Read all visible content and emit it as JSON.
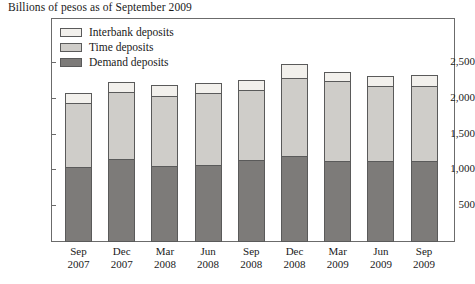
{
  "chart_data": {
    "type": "bar",
    "stacked": true,
    "title": "Billions of pesos as of September 2009",
    "xlabel": "",
    "ylabel": "",
    "ylim": [
      0,
      2750
    ],
    "grid": false,
    "legend_position": "top-left",
    "ytick_labels": [
      "2,500",
      "2,000",
      "1,500",
      "1,000",
      "500"
    ],
    "ytick_values": [
      2500,
      2000,
      1500,
      1000,
      500
    ],
    "categories": [
      {
        "month": "Sep",
        "year": "2007"
      },
      {
        "month": "Dec",
        "year": "2007"
      },
      {
        "month": "Mar",
        "year": "2008"
      },
      {
        "month": "Jun",
        "year": "2008"
      },
      {
        "month": "Sep",
        "year": "2008"
      },
      {
        "month": "Dec",
        "year": "2008"
      },
      {
        "month": "Mar",
        "year": "2009"
      },
      {
        "month": "Jun",
        "year": "2009"
      },
      {
        "month": "Sep",
        "year": "2009"
      }
    ],
    "series": [
      {
        "name": "Demand deposits",
        "color": "#7d7b79",
        "values": [
          1050,
          1155,
          1065,
          1075,
          1145,
          1195,
          1125,
          1130,
          1130
        ]
      },
      {
        "name": "Time deposits",
        "color": "#cfcdc9",
        "values": [
          890,
          945,
          975,
          1000,
          985,
          1095,
          1130,
          1050,
          1045
        ]
      },
      {
        "name": "Interbank deposits",
        "color": "#f2f0ec",
        "values": [
          135,
          130,
          155,
          150,
          140,
          200,
          120,
          140,
          155
        ]
      }
    ],
    "totals": [
      2075,
      2230,
      2195,
      2225,
      2270,
      2490,
      2375,
      2320,
      2330
    ],
    "legend_order": [
      "Interbank deposits",
      "Time deposits",
      "Demand deposits"
    ]
  },
  "style": {
    "frame_color": "#6b6b6b",
    "bar_outline": "#5a5a5a",
    "background": "#ffffff",
    "text_color": "#1a1a1a"
  }
}
